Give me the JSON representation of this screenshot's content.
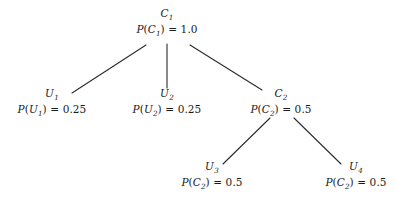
{
  "diagram": {
    "type": "probability-tree",
    "background_color": "#ffffff",
    "edge_color": "#2b2b2b",
    "text_color": "#1b1b1b",
    "nodes": [
      {
        "id": "c1",
        "name": "C",
        "subscript": "1",
        "prob_fn": "P",
        "prob_arg": "C",
        "prob_arg_sub": "1",
        "prob_value": "1.0",
        "x": 167,
        "y": 8
      },
      {
        "id": "u1",
        "name": "U",
        "subscript": "1",
        "prob_fn": "P",
        "prob_arg": "U",
        "prob_arg_sub": "1",
        "prob_value": "0.25",
        "x": 52,
        "y": 88
      },
      {
        "id": "u2",
        "name": "U",
        "subscript": "2",
        "prob_fn": "P",
        "prob_arg": "U",
        "prob_arg_sub": "2",
        "prob_value": "0.25",
        "x": 167,
        "y": 88
      },
      {
        "id": "c2",
        "name": "C",
        "subscript": "2",
        "prob_fn": "P",
        "prob_arg": "C",
        "prob_arg_sub": "2",
        "prob_value": "0.5",
        "x": 281,
        "y": 88
      },
      {
        "id": "u3",
        "name": "U",
        "subscript": "3",
        "prob_fn": "P",
        "prob_arg": "C",
        "prob_arg_sub": "2",
        "prob_value": "0.5",
        "x": 212,
        "y": 161
      },
      {
        "id": "u4",
        "name": "U",
        "subscript": "4",
        "prob_fn": "P",
        "prob_arg": "C",
        "prob_arg_sub": "2",
        "prob_value": "0.5",
        "x": 356,
        "y": 161
      }
    ],
    "edges": [
      {
        "id": "c1-u1",
        "from": "c1",
        "to": "u1",
        "x1": 146,
        "y1": 45,
        "x2": 72,
        "y2": 93
      },
      {
        "id": "c1-u2",
        "from": "c1",
        "to": "u2",
        "x1": 167,
        "y1": 44,
        "x2": 167,
        "y2": 88
      },
      {
        "id": "c1-c2",
        "from": "c1",
        "to": "c2",
        "x1": 190,
        "y1": 45,
        "x2": 262,
        "y2": 90
      },
      {
        "id": "c2-u3",
        "from": "c2",
        "to": "u3",
        "x1": 270,
        "y1": 118,
        "x2": 223,
        "y2": 164
      },
      {
        "id": "c2-u4",
        "from": "c2",
        "to": "u4",
        "x1": 294,
        "y1": 118,
        "x2": 341,
        "y2": 164
      }
    ],
    "equals_sign": "=",
    "paren_open": "(",
    "paren_close": ")"
  }
}
